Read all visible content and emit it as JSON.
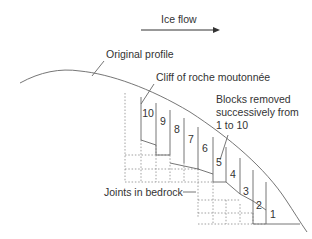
{
  "labels": {
    "ice_flow": "Ice flow",
    "original_profile": "Original profile",
    "cliff": "Cliff of roche moutonnée",
    "blocks_line1": "Blocks removed",
    "blocks_line2": "successively from",
    "blocks_line3": "1 to 10",
    "joints": "Joints in bedrock"
  },
  "blocks": [
    "10",
    "9",
    "8",
    "7",
    "6",
    "5",
    "4",
    "3",
    "2",
    "1"
  ],
  "colors": {
    "line": "#666666",
    "text": "#333333",
    "background": "#ffffff"
  }
}
